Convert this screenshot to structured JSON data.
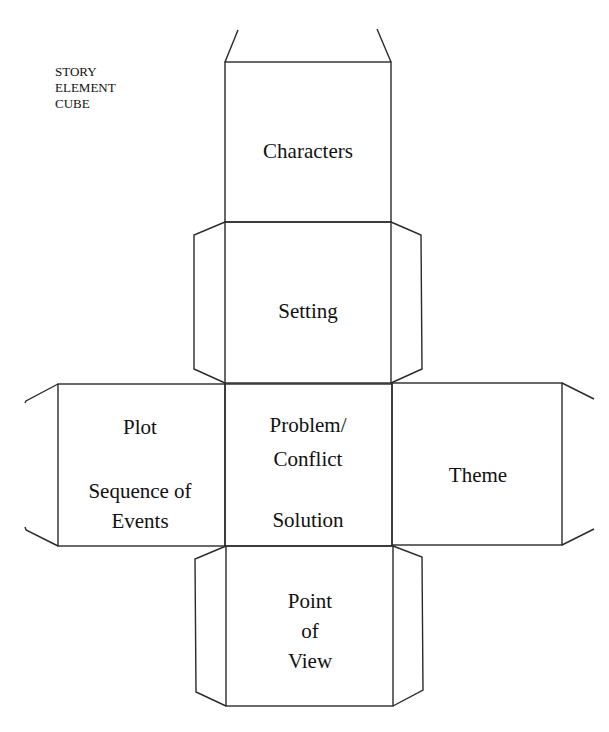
{
  "title": {
    "lines": [
      "STORY",
      "ELEMENT",
      "CUBE"
    ]
  },
  "faces": {
    "top": {
      "lines": [
        "Characters"
      ]
    },
    "upper_middle": {
      "lines": [
        "Setting"
      ]
    },
    "left": {
      "lines": [
        "Plot",
        "Sequence of",
        "Events"
      ]
    },
    "center": {
      "lines": [
        "Problem/",
        "Conflict",
        "Solution"
      ]
    },
    "right": {
      "lines": [
        "Theme"
      ]
    },
    "bottom": {
      "lines": [
        "Point",
        "of",
        "View"
      ]
    }
  },
  "colors": {
    "line": "#2a2a2a",
    "text": "#111111",
    "background": "#ffffff"
  }
}
